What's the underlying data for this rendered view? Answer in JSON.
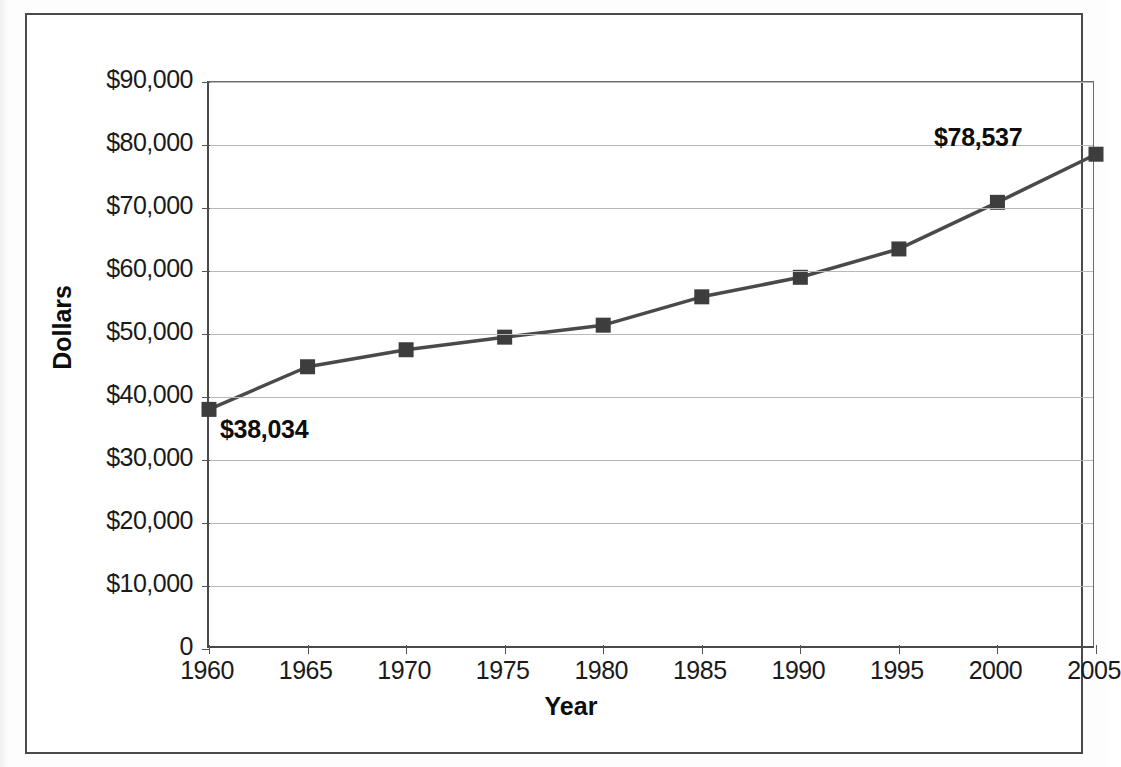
{
  "chart_data": {
    "type": "line",
    "title": "",
    "xlabel": "Year",
    "ylabel": "Dollars",
    "x": [
      1960,
      1965,
      1970,
      1975,
      1980,
      1985,
      1990,
      1995,
      2000,
      2005
    ],
    "categories": [
      "1960",
      "1965",
      "1970",
      "1975",
      "1980",
      "1985",
      "1990",
      "1995",
      "2000",
      "2005"
    ],
    "values": [
      38034,
      44800,
      47500,
      49500,
      51400,
      55900,
      59000,
      63500,
      70900,
      78537
    ],
    "series": [
      {
        "name": "Dollars",
        "values": [
          38034,
          44800,
          47500,
          49500,
          51400,
          55900,
          59000,
          63500,
          70900,
          78537
        ]
      }
    ],
    "xlim": [
      1960,
      2005
    ],
    "ylim": [
      0,
      90000
    ],
    "ytick_values": [
      0,
      10000,
      20000,
      30000,
      40000,
      50000,
      60000,
      70000,
      80000,
      90000
    ],
    "ytick_labels": [
      "0",
      "$10,000",
      "$20,000",
      "$30,000",
      "$40,000",
      "$50,000",
      "$60,000",
      "$70,000",
      "$80,000",
      "$90,000"
    ],
    "xtick_labels": [
      "1960",
      "1965",
      "1970",
      "1975",
      "1980",
      "1985",
      "1990",
      "1995",
      "2000",
      "2005"
    ],
    "grid": "horizontal",
    "legend": "none",
    "marker": "square",
    "line_color": "#4a4a4a",
    "marker_color": "#3d3d3d",
    "gridline_color": "#b8b8b8",
    "annotations": [
      {
        "text": "$38,034",
        "x": 1960,
        "y": 38034,
        "position": "below-right"
      },
      {
        "text": "$78,537",
        "x": 2005,
        "y": 78537,
        "position": "above-left"
      }
    ]
  },
  "axis": {
    "y_title": "Dollars",
    "x_title": "Year"
  },
  "annotation_labels": {
    "first": "$38,034",
    "last": "$78,537"
  }
}
